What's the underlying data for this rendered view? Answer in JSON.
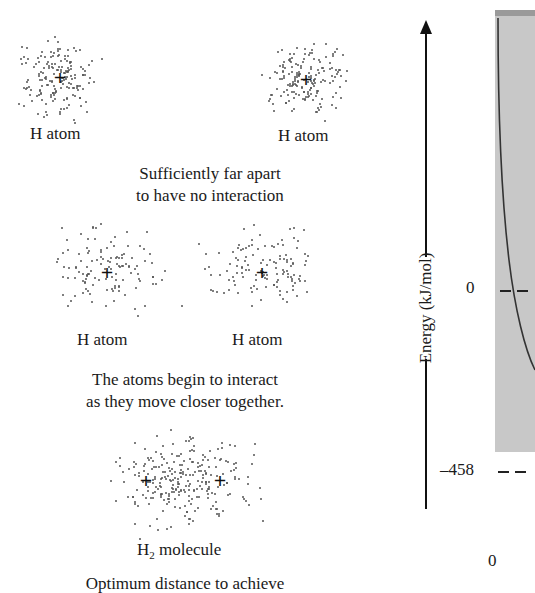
{
  "figure": {
    "panels": [
      {
        "id": "far-apart",
        "atom_labels": [
          "H atom",
          "H atom"
        ],
        "caption_lines": [
          "Sufficiently far apart",
          "to have no interaction"
        ]
      },
      {
        "id": "interacting",
        "atom_labels": [
          "H atom",
          "H atom"
        ],
        "caption_lines": [
          "The atoms begin to interact",
          "as they move closer together."
        ]
      },
      {
        "id": "molecule",
        "molecule_label_main": "H",
        "molecule_label_sub": "2",
        "molecule_label_rest": " molecule",
        "caption_lines": [
          "Optimum distance to achieve"
        ]
      }
    ],
    "nucleus_symbol": "+",
    "energy_axis": {
      "title": "Energy (kJ/mol)",
      "ticks": [
        "0",
        "–458"
      ],
      "x_origin_label": "0"
    },
    "colors": {
      "plot_background": "#c8c8c8",
      "curve": "#333333",
      "text": "#1a1a1a"
    }
  },
  "chart_data": {
    "type": "line",
    "title": "",
    "ylabel": "Energy (kJ/mol)",
    "xlabel": "",
    "y_ticks": [
      0,
      -458
    ],
    "x_ticks": [
      0
    ],
    "annotations": [
      "dashed line at 0",
      "dashed line at -458"
    ],
    "series": [
      {
        "name": "potential energy curve (partially visible)",
        "description": "steeply decreasing curve crossing 0 near left edge"
      }
    ]
  }
}
